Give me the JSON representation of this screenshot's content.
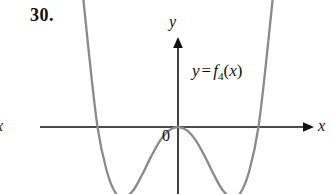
{
  "figure": {
    "problem_number": "30.",
    "function_label": {
      "lhs": "y",
      "equals": "=",
      "fname": "f",
      "subscript": "4",
      "open_paren": "(",
      "arg": "x",
      "close_paren": ")",
      "full_text": "y = f4(x)"
    },
    "axes": {
      "y_label": "y",
      "x_label_right": "x",
      "x_label_left": "x",
      "origin_label": "0"
    },
    "colors": {
      "curve": "#8a8a8a",
      "axis": "#111111",
      "text": "#111111",
      "background": "#ffffff"
    }
  },
  "chart_data": {
    "type": "line",
    "title": "",
    "xlabel": "x",
    "ylabel": "y",
    "legend": [
      "y = f4(x)"
    ],
    "grid": false,
    "axis_origin_label": "0",
    "xlim": [
      -3.2,
      3.2
    ],
    "ylim": [
      -1.1,
      3.2
    ],
    "roots": [
      -1.8,
      0,
      1.8
    ],
    "double_roots": [
      0
    ],
    "local_minima": [
      {
        "x": -1.15,
        "y": -0.62
      },
      {
        "x": 1.15,
        "y": -0.6
      }
    ],
    "local_maxima": [
      {
        "x": 0,
        "y": 0
      }
    ],
    "series": [
      {
        "name": "y = f4(x)",
        "x": [
          -2.55,
          -2.4,
          -2.2,
          -2.0,
          -1.8,
          -1.6,
          -1.4,
          -1.2,
          -1.0,
          -0.8,
          -0.6,
          -0.4,
          -0.2,
          0.0,
          0.2,
          0.4,
          0.6,
          0.8,
          1.0,
          1.2,
          1.4,
          1.6,
          1.8,
          2.0,
          2.2,
          2.4,
          2.55
        ],
        "y": [
          3.05,
          2.3,
          1.45,
          0.68,
          0.0,
          -0.38,
          -0.58,
          -0.62,
          -0.56,
          -0.42,
          -0.26,
          -0.12,
          -0.03,
          0.0,
          -0.03,
          -0.12,
          -0.26,
          -0.42,
          -0.56,
          -0.62,
          -0.58,
          -0.38,
          0.0,
          0.68,
          1.45,
          2.3,
          3.05
        ]
      }
    ]
  }
}
